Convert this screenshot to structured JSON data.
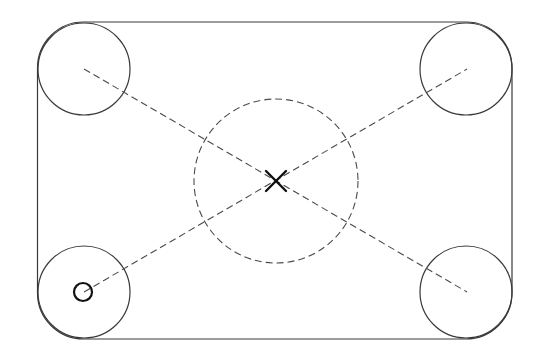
{
  "canvas": {
    "width": 541,
    "height": 358,
    "background": "#ffffff"
  },
  "colors": {
    "line": "#3a3a3a",
    "dashed": "#4a4a4a",
    "marker": "#111111"
  },
  "outline": {
    "left": 37.5,
    "right": 512,
    "top": 22,
    "bottom": 339,
    "corner_radius": 46
  },
  "corner_circles": [
    {
      "id": "top-left",
      "cx": 84,
      "cy": 69,
      "r": 46
    },
    {
      "id": "top-right",
      "cx": 466,
      "cy": 69,
      "r": 46
    },
    {
      "id": "bottom-left",
      "cx": 84,
      "cy": 292,
      "r": 46
    },
    {
      "id": "bottom-right",
      "cx": 466,
      "cy": 292,
      "r": 46
    }
  ],
  "center_circle": {
    "cx": 276,
    "cy": 181,
    "r": 82,
    "style": "dashed"
  },
  "diagonals": [
    {
      "id": "diagonal-tl-br",
      "x1": 84,
      "y1": 69,
      "x2": 467,
      "y2": 292
    },
    {
      "id": "diagonal-bl-tr",
      "x1": 84,
      "y1": 292,
      "x2": 467,
      "y2": 69
    }
  ],
  "center_cross": {
    "cx": 276,
    "cy": 181,
    "half": 10
  },
  "origin_marker": {
    "cx": 83,
    "cy": 292,
    "r": 9
  }
}
